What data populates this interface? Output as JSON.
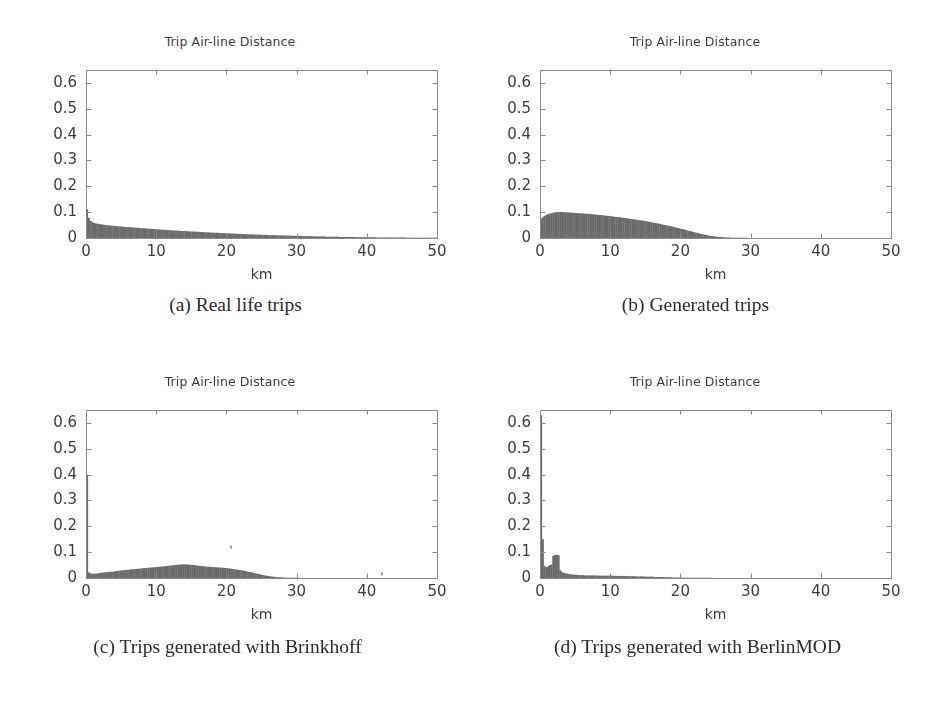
{
  "figure": {
    "background": "#ffffff",
    "ink_color": "#5a5a5a",
    "bar_color": "#6b6b6b",
    "axis_color": "#8a8a8a",
    "tick_label_color": "#3d3d3d"
  },
  "panels": [
    {
      "id": "a",
      "caption": "(a) Real life trips",
      "chart_data": {
        "type": "bar",
        "title": "Trip Air-line Distance",
        "xlabel": "km",
        "ylabel": "",
        "xlim": [
          0,
          50
        ],
        "ylim": [
          0,
          0.65
        ],
        "xticks": [
          0,
          10,
          20,
          30,
          40,
          50
        ],
        "xticklabels": [
          "0",
          "10",
          "20",
          "30",
          "40",
          "50"
        ],
        "yticks": [
          0,
          0.1,
          0.2,
          0.3,
          0.4,
          0.5,
          0.6
        ],
        "yticklabels": [
          "0",
          "0.1",
          "0.2",
          "0.3",
          "0.4",
          "0.5",
          "0.6"
        ],
        "grid": false,
        "legend": "none",
        "bin_width": 0.25,
        "bin_start": 0,
        "values": [
          0.112,
          0.078,
          0.066,
          0.061,
          0.058,
          0.056,
          0.055,
          0.054,
          0.053,
          0.052,
          0.051,
          0.05,
          0.049,
          0.049,
          0.048,
          0.047,
          0.046,
          0.046,
          0.045,
          0.045,
          0.044,
          0.043,
          0.043,
          0.042,
          0.042,
          0.041,
          0.041,
          0.04,
          0.04,
          0.039,
          0.039,
          0.038,
          0.038,
          0.037,
          0.037,
          0.036,
          0.036,
          0.035,
          0.035,
          0.034,
          0.034,
          0.033,
          0.033,
          0.032,
          0.032,
          0.031,
          0.031,
          0.03,
          0.03,
          0.029,
          0.029,
          0.029,
          0.028,
          0.028,
          0.027,
          0.027,
          0.027,
          0.026,
          0.026,
          0.025,
          0.025,
          0.025,
          0.024,
          0.024,
          0.024,
          0.023,
          0.023,
          0.022,
          0.022,
          0.022,
          0.021,
          0.021,
          0.021,
          0.02,
          0.02,
          0.02,
          0.019,
          0.019,
          0.019,
          0.018,
          0.018,
          0.018,
          0.017,
          0.017,
          0.017,
          0.016,
          0.016,
          0.016,
          0.016,
          0.015,
          0.015,
          0.015,
          0.014,
          0.014,
          0.014,
          0.014,
          0.013,
          0.013,
          0.013,
          0.013,
          0.012,
          0.012,
          0.012,
          0.012,
          0.011,
          0.011,
          0.011,
          0.011,
          0.01,
          0.01,
          0.01,
          0.01,
          0.01,
          0.009,
          0.009,
          0.009,
          0.009,
          0.009,
          0.008,
          0.008,
          0.008,
          0.008,
          0.008,
          0.007,
          0.007,
          0.007,
          0.007,
          0.007,
          0.007,
          0.006,
          0.006,
          0.006,
          0.006,
          0.006,
          0.006,
          0.006,
          0.005,
          0.005,
          0.005,
          0.005,
          0.005,
          0.005,
          0.005,
          0.005,
          0.004,
          0.004,
          0.004,
          0.004,
          0.004,
          0.004,
          0.004,
          0.004,
          0.004,
          0.003,
          0.003,
          0.003,
          0.003,
          0.003,
          0.003,
          0.003,
          0.003,
          0.003,
          0.003,
          0.003,
          0.003,
          0.002,
          0.002,
          0.002,
          0.002,
          0.002,
          0.002,
          0.002,
          0.002,
          0.002,
          0.002,
          0.002,
          0.002,
          0.002,
          0.002,
          0.002,
          0.002,
          0.002,
          0.001,
          0.001,
          0.001,
          0.001,
          0.001,
          0.001,
          0.001,
          0.001,
          0.001,
          0.001,
          0.001,
          0.001,
          0.001,
          0.001,
          0.001,
          0.001,
          0.001,
          0.001
        ]
      }
    },
    {
      "id": "b",
      "caption": "(b) Generated trips",
      "chart_data": {
        "type": "bar",
        "title": "Trip Air-line Distance",
        "xlabel": "km",
        "ylabel": "",
        "xlim": [
          0,
          50
        ],
        "ylim": [
          0,
          0.65
        ],
        "xticks": [
          0,
          10,
          20,
          30,
          40,
          50
        ],
        "xticklabels": [
          "0",
          "10",
          "20",
          "30",
          "40",
          "50"
        ],
        "yticks": [
          0,
          0.1,
          0.2,
          0.3,
          0.4,
          0.5,
          0.6
        ],
        "yticklabels": [
          "0",
          "0.1",
          "0.2",
          "0.3",
          "0.4",
          "0.5",
          "0.6"
        ],
        "grid": false,
        "legend": "none",
        "bin_width": 0.25,
        "bin_start": 0,
        "values": [
          0.074,
          0.08,
          0.085,
          0.089,
          0.092,
          0.094,
          0.096,
          0.098,
          0.099,
          0.1,
          0.1,
          0.101,
          0.101,
          0.1,
          0.1,
          0.099,
          0.099,
          0.098,
          0.098,
          0.097,
          0.097,
          0.096,
          0.096,
          0.095,
          0.095,
          0.094,
          0.094,
          0.093,
          0.093,
          0.092,
          0.091,
          0.091,
          0.09,
          0.089,
          0.089,
          0.088,
          0.087,
          0.086,
          0.086,
          0.085,
          0.084,
          0.083,
          0.082,
          0.082,
          0.081,
          0.08,
          0.079,
          0.078,
          0.077,
          0.076,
          0.075,
          0.074,
          0.073,
          0.072,
          0.071,
          0.07,
          0.069,
          0.068,
          0.067,
          0.066,
          0.065,
          0.063,
          0.062,
          0.061,
          0.06,
          0.058,
          0.057,
          0.056,
          0.054,
          0.053,
          0.051,
          0.05,
          0.048,
          0.047,
          0.045,
          0.044,
          0.042,
          0.04,
          0.039,
          0.037,
          0.035,
          0.034,
          0.032,
          0.03,
          0.028,
          0.027,
          0.025,
          0.023,
          0.021,
          0.02,
          0.018,
          0.016,
          0.015,
          0.013,
          0.012,
          0.01,
          0.009,
          0.008,
          0.007,
          0.006,
          0.005,
          0.004,
          0.004,
          0.003,
          0.003,
          0.002,
          0.002,
          0.002,
          0.001,
          0.001,
          0.001,
          0.001,
          0.001,
          0.001,
          0.001,
          0.001,
          0.001,
          0.001,
          0.0,
          0.0,
          0.0,
          0.0,
          0.0,
          0.0,
          0.0,
          0.0,
          0.0,
          0.0,
          0.0,
          0.0,
          0.0,
          0.0,
          0.0,
          0.0,
          0.0,
          0.0,
          0.0,
          0.0,
          0.0,
          0.0,
          0.0,
          0.0,
          0.0,
          0.0,
          0.0,
          0.0,
          0.0,
          0.0,
          0.0,
          0.0,
          0.0,
          0.0,
          0.0,
          0.0,
          0.0,
          0.0,
          0.0,
          0.0,
          0.0,
          0.0,
          0.0,
          0.0,
          0.0,
          0.0,
          0.0,
          0.0,
          0.0,
          0.0,
          0.0,
          0.0,
          0.0,
          0.0,
          0.0,
          0.0,
          0.0,
          0.0,
          0.0,
          0.0,
          0.0,
          0.0,
          0.0,
          0.0,
          0.0,
          0.0,
          0.0,
          0.0,
          0.0,
          0.0,
          0.0,
          0.0,
          0.0,
          0.0,
          0.0,
          0.0,
          0.0,
          0.0,
          0.0,
          0.0,
          0.0,
          0.0
        ]
      }
    },
    {
      "id": "c",
      "caption": "(c) Trips generated with Brinkhoff",
      "chart_data": {
        "type": "bar",
        "title": "Trip Air-line Distance",
        "xlabel": "km",
        "ylabel": "",
        "xlim": [
          0,
          50
        ],
        "ylim": [
          0,
          0.65
        ],
        "xticks": [
          0,
          10,
          20,
          30,
          40,
          50
        ],
        "xticklabels": [
          "0",
          "10",
          "20",
          "30",
          "40",
          "50"
        ],
        "yticks": [
          0,
          0.1,
          0.2,
          0.3,
          0.4,
          0.5,
          0.6
        ],
        "yticklabels": [
          "0",
          "0.1",
          "0.2",
          "0.3",
          "0.4",
          "0.5",
          "0.6"
        ],
        "grid": false,
        "legend": "none",
        "bin_width": 0.25,
        "bin_start": 0,
        "values": [
          0.4,
          0.022,
          0.018,
          0.017,
          0.016,
          0.017,
          0.018,
          0.019,
          0.02,
          0.021,
          0.022,
          0.022,
          0.023,
          0.024,
          0.024,
          0.025,
          0.026,
          0.027,
          0.028,
          0.029,
          0.03,
          0.03,
          0.031,
          0.032,
          0.032,
          0.033,
          0.034,
          0.034,
          0.035,
          0.036,
          0.036,
          0.037,
          0.038,
          0.038,
          0.039,
          0.04,
          0.04,
          0.041,
          0.041,
          0.042,
          0.043,
          0.043,
          0.044,
          0.045,
          0.045,
          0.046,
          0.047,
          0.048,
          0.048,
          0.049,
          0.05,
          0.051,
          0.051,
          0.052,
          0.052,
          0.053,
          0.053,
          0.052,
          0.052,
          0.051,
          0.051,
          0.05,
          0.049,
          0.048,
          0.047,
          0.046,
          0.046,
          0.045,
          0.044,
          0.044,
          0.043,
          0.043,
          0.042,
          0.042,
          0.041,
          0.041,
          0.04,
          0.04,
          0.039,
          0.039,
          0.038,
          0.037,
          0.036,
          0.035,
          0.034,
          0.033,
          0.032,
          0.031,
          0.03,
          0.029,
          0.027,
          0.026,
          0.024,
          0.023,
          0.021,
          0.02,
          0.018,
          0.016,
          0.015,
          0.013,
          0.012,
          0.01,
          0.009,
          0.008,
          0.007,
          0.006,
          0.005,
          0.004,
          0.004,
          0.003,
          0.003,
          0.002,
          0.002,
          0.002,
          0.001,
          0.001,
          0.001,
          0.001,
          0.001,
          0.001,
          0.001,
          0.001,
          0.0,
          0.0,
          0.0,
          0.0,
          0.0,
          0.0,
          0.0,
          0.0,
          0.0,
          0.0,
          0.0,
          0.0,
          0.0,
          0.0,
          0.0,
          0.0,
          0.0,
          0.0,
          0.0,
          0.0,
          0.0,
          0.0,
          0.0,
          0.0,
          0.0,
          0.0,
          0.0,
          0.0,
          0.0,
          0.0,
          0.0,
          0.0,
          0.0,
          0.0,
          0.0,
          0.0,
          0.0,
          0.0,
          0.0,
          0.0,
          0.0,
          0.0,
          0.0,
          0.0,
          0.0,
          0.0,
          0.0,
          0.0,
          0.0,
          0.0,
          0.0,
          0.0,
          0.0,
          0.0,
          0.0,
          0.0,
          0.0,
          0.0,
          0.0,
          0.0,
          0.0,
          0.0,
          0.0,
          0.0,
          0.0,
          0.0,
          0.0,
          0.0,
          0.0,
          0.0,
          0.0,
          0.0,
          0.0,
          0.0,
          0.0,
          0.0,
          0.0,
          0.0
        ],
        "annotations": [
          {
            "label": "stray-mark",
            "x": 20.5,
            "y": 0.125
          },
          {
            "label": "stray-mark",
            "x": 42.0,
            "y": 0.022
          }
        ]
      }
    },
    {
      "id": "d",
      "caption": "(d) Trips generated with BerlinMOD",
      "chart_data": {
        "type": "bar",
        "title": "Trip Air-line Distance",
        "xlabel": "km",
        "ylabel": "",
        "xlim": [
          0,
          50
        ],
        "ylim": [
          0,
          0.65
        ],
        "xticks": [
          0,
          10,
          20,
          30,
          40,
          50
        ],
        "xticklabels": [
          "0",
          "10",
          "20",
          "30",
          "40",
          "50"
        ],
        "yticks": [
          0,
          0.1,
          0.2,
          0.3,
          0.4,
          0.5,
          0.6
        ],
        "yticklabels": [
          "0",
          "0.1",
          "0.2",
          "0.3",
          "0.4",
          "0.5",
          "0.6"
        ],
        "grid": false,
        "legend": "none",
        "bin_width": 0.25,
        "bin_start": 0,
        "values": [
          0.63,
          0.15,
          0.046,
          0.042,
          0.045,
          0.05,
          0.052,
          0.086,
          0.09,
          0.089,
          0.088,
          0.03,
          0.022,
          0.02,
          0.018,
          0.017,
          0.015,
          0.014,
          0.013,
          0.013,
          0.012,
          0.012,
          0.011,
          0.011,
          0.011,
          0.01,
          0.01,
          0.01,
          0.01,
          0.01,
          0.01,
          0.01,
          0.01,
          0.009,
          0.009,
          0.009,
          0.009,
          0.009,
          0.009,
          0.009,
          0.009,
          0.009,
          0.008,
          0.008,
          0.008,
          0.008,
          0.008,
          0.008,
          0.008,
          0.007,
          0.007,
          0.007,
          0.007,
          0.007,
          0.007,
          0.006,
          0.006,
          0.006,
          0.006,
          0.006,
          0.005,
          0.005,
          0.005,
          0.005,
          0.005,
          0.004,
          0.004,
          0.004,
          0.004,
          0.004,
          0.003,
          0.003,
          0.003,
          0.003,
          0.003,
          0.002,
          0.002,
          0.002,
          0.002,
          0.002,
          0.002,
          0.001,
          0.001,
          0.001,
          0.001,
          0.001,
          0.001,
          0.001,
          0.001,
          0.001,
          0.001,
          0.001,
          0.001,
          0.001,
          0.001,
          0.001,
          0.001,
          0.001,
          0.0,
          0.0,
          0.0,
          0.0,
          0.0,
          0.0,
          0.0,
          0.0,
          0.0,
          0.0,
          0.0,
          0.0,
          0.0,
          0.0,
          0.0,
          0.0,
          0.0,
          0.0,
          0.0,
          0.0,
          0.0,
          0.0,
          0.0,
          0.0,
          0.0,
          0.0,
          0.0,
          0.0,
          0.0,
          0.0,
          0.0,
          0.0,
          0.0,
          0.0,
          0.0,
          0.0,
          0.0,
          0.0,
          0.0,
          0.0,
          0.0,
          0.0,
          0.0,
          0.0,
          0.0,
          0.0,
          0.0,
          0.0,
          0.0,
          0.0,
          0.0,
          0.0,
          0.0,
          0.0,
          0.0,
          0.0,
          0.0,
          0.0,
          0.0,
          0.0,
          0.0,
          0.0,
          0.0,
          0.0,
          0.0,
          0.0,
          0.0,
          0.0,
          0.0,
          0.0,
          0.0,
          0.0,
          0.0,
          0.0,
          0.0,
          0.0,
          0.0,
          0.0,
          0.0,
          0.0,
          0.0,
          0.0,
          0.0,
          0.0,
          0.0,
          0.0,
          0.0,
          0.0,
          0.0,
          0.0,
          0.0,
          0.0,
          0.0,
          0.0,
          0.0,
          0.0,
          0.0,
          0.0,
          0.0,
          0.0,
          0.0,
          0.0
        ]
      }
    }
  ]
}
